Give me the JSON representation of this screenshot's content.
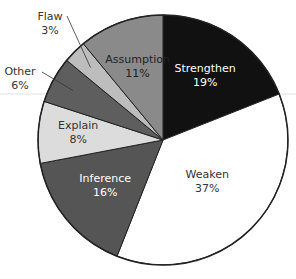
{
  "chart_data": {
    "type": "pie",
    "title": "",
    "start_angle": "12 o'clock",
    "direction": "clockwise",
    "categories": [
      "Strengthen",
      "Weaken",
      "Inference",
      "Explain",
      "Other",
      "Flaw",
      "Assumption"
    ],
    "values": [
      19,
      37,
      16,
      8,
      6,
      3,
      11
    ],
    "labels": [
      "19%",
      "37%",
      "16%",
      "8%",
      "6%",
      "3%",
      "11%"
    ],
    "colors": [
      "#111111",
      "#ffffff",
      "#555555",
      "#dcdcdc",
      "#5e5e5e",
      "#bdbdbd",
      "#8a8a8a"
    ],
    "label_colors": [
      "#ffffff",
      "#333333",
      "#ffffff",
      "#333333",
      "#333333",
      "#333333",
      "#222222"
    ],
    "outside_labels": [
      "Other",
      "Flaw"
    ],
    "legend": "none (labels on slices)"
  }
}
